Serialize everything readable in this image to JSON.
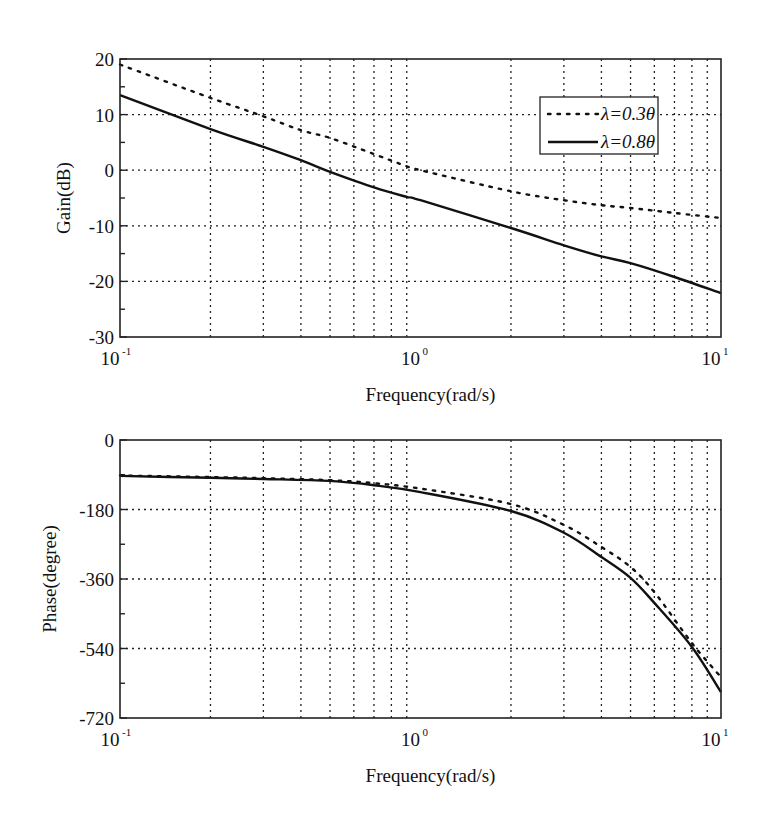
{
  "chart_data": [
    {
      "type": "line",
      "title": "",
      "xlabel": "Frequency(rad/s)",
      "ylabel": "Gain(dB)",
      "xscale": "log",
      "xlim": [
        0.1,
        10
      ],
      "ylim": [
        -30,
        20
      ],
      "x_tick_labels": [
        {
          "base": "10",
          "exp": "-1",
          "value": 0.1
        },
        {
          "base": "10",
          "exp": "0",
          "value": 1
        },
        {
          "base": "10",
          "exp": "1",
          "value": 10
        }
      ],
      "y_ticks": [
        20,
        10,
        0,
        -10,
        -20,
        -30
      ],
      "grid": true,
      "legend_position": "upper right",
      "legend": [
        "λ=0.3θ",
        "λ=0.8θ"
      ],
      "x": [
        0.1,
        0.2,
        0.3,
        0.4,
        0.5,
        0.7,
        0.9,
        1,
        2,
        3,
        4,
        5,
        7,
        10
      ],
      "series": [
        {
          "name": "λ=0.3θ",
          "style": "dotted",
          "values": [
            19.0,
            13.0,
            9.7,
            7.2,
            5.8,
            2.9,
            0.7,
            0.0,
            -3.8,
            -5.4,
            -6.3,
            -6.8,
            -7.7,
            -8.6
          ]
        },
        {
          "name": "λ=0.8θ",
          "style": "solid",
          "values": [
            13.5,
            7.4,
            4.2,
            1.8,
            -0.3,
            -3.1,
            -4.8,
            -5.4,
            -10.4,
            -13.5,
            -15.5,
            -16.7,
            -19.2,
            -22.1
          ]
        }
      ]
    },
    {
      "type": "line",
      "title": "",
      "xlabel": "Frequency(rad/s)",
      "ylabel": "Phase(degree)",
      "xscale": "log",
      "xlim": [
        0.1,
        10
      ],
      "ylim": [
        -720,
        0
      ],
      "x_tick_labels": [
        {
          "base": "10",
          "exp": "-1",
          "value": 0.1
        },
        {
          "base": "10",
          "exp": "0",
          "value": 1
        },
        {
          "base": "10",
          "exp": "1",
          "value": 10
        }
      ],
      "y_ticks": [
        0,
        -180,
        -360,
        -540,
        -720
      ],
      "grid": true,
      "legend_position": "none",
      "x": [
        0.1,
        0.2,
        0.3,
        0.5,
        0.7,
        1,
        2,
        3,
        4,
        5,
        6,
        8,
        10
      ],
      "series": [
        {
          "name": "λ=0.3θ",
          "style": "dotted",
          "values": [
            -92,
            -96,
            -99,
            -104,
            -112,
            -126,
            -166,
            -220,
            -277,
            -329,
            -394,
            -526,
            -614
          ]
        },
        {
          "name": "λ=0.8θ",
          "style": "solid",
          "values": [
            -93,
            -98,
            -101,
            -106,
            -117,
            -135,
            -184,
            -240,
            -303,
            -357,
            -422,
            -536,
            -653
          ]
        }
      ]
    }
  ],
  "legend": {
    "items": [
      {
        "label": "λ=0.3θ",
        "style": "dotted"
      },
      {
        "label": "λ=0.8θ",
        "style": "solid"
      }
    ]
  },
  "colors": {
    "line": "#111111",
    "grid": "#222222",
    "background": "#ffffff"
  }
}
